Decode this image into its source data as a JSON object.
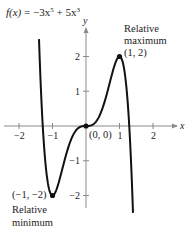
{
  "chart_data": {
    "type": "line",
    "title_parts": {
      "fx": "f(x)",
      "rest": " = −3x",
      "exp5": "5",
      "plus": " + 5x",
      "exp3": "3"
    },
    "function": {
      "coefficients": {
        "x5": -3,
        "x3": 5
      }
    },
    "xlabel": "x",
    "ylabel": "y",
    "xlim": [
      -2.5,
      2.7
    ],
    "ylim": [
      -2.5,
      2.8
    ],
    "curve_domain": [
      -1.403,
      1.403
    ],
    "x_ticks": [
      {
        "value": -2,
        "label": "−2"
      },
      {
        "value": -1,
        "label": "−1"
      },
      {
        "value": 1,
        "label": "1"
      },
      {
        "value": 2,
        "label": "2"
      }
    ],
    "y_ticks": [
      {
        "value": -2,
        "label": "−2"
      },
      {
        "value": -1,
        "label": "−1"
      },
      {
        "value": 1,
        "label": "1"
      },
      {
        "value": 2,
        "label": "2"
      }
    ],
    "points": [
      {
        "x": 1,
        "y": 2,
        "label": "(1, 2)",
        "annotation": [
          "Relative",
          "maximum"
        ]
      },
      {
        "x": 0,
        "y": 0,
        "label": "(0, 0)",
        "annotation": []
      },
      {
        "x": -1,
        "y": -2,
        "label": "(−1, −2)",
        "annotation": [
          "Relative",
          "minimum"
        ]
      }
    ],
    "grid": false,
    "legend": false
  },
  "colors": {
    "curve": "#111111",
    "axis": "#8a8a8a",
    "text": "#222222"
  }
}
